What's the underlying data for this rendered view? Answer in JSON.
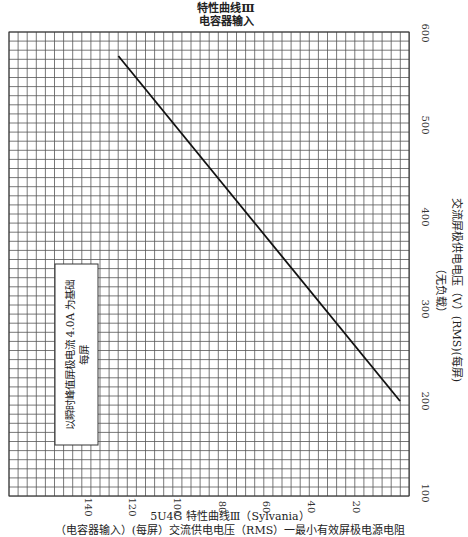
{
  "chart_data": {
    "type": "line",
    "title": "特性曲线Ⅲ",
    "subtitle": "电容器输入",
    "caption_title": "5U4G 特性曲线Ⅲ（Sylvania）",
    "xlabel": "（电容器输入）(每屏）交流供电电压（RMS）一最小有效屏极电源电阻",
    "ylabel": "交流屏极供电电压（V）(RMS)(每屏)",
    "ylabel_note": "（无负载）",
    "x_ticks": [
      140,
      120,
      100,
      80,
      60,
      40,
      20
    ],
    "y_ticks": [
      100,
      200,
      300,
      400,
      500,
      600
    ],
    "xlim": [
      160,
      0
    ],
    "ylim": [
      100,
      600
    ],
    "grid": true,
    "annotation": {
      "line1": "以瞬时峰值屏极电流 4.0A 为基础",
      "line2": "每屏"
    },
    "series": [
      {
        "name": "capacitor-input",
        "points": [
          [
            126,
            575
          ],
          [
            0,
            200
          ]
        ]
      }
    ]
  }
}
